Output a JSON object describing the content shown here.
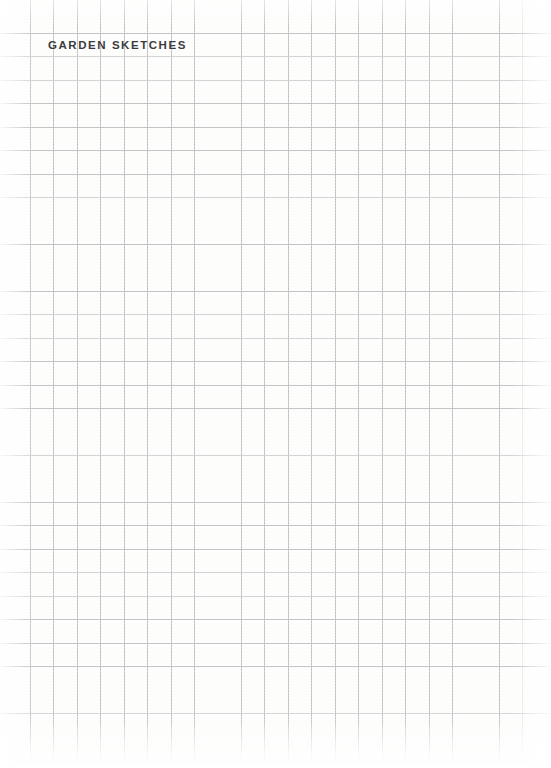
{
  "page": {
    "kind": "grid-paper-sheet",
    "width": 551,
    "height": 768,
    "paper_color": "#fdfdfc",
    "grid_line_color": "#c3c3c8",
    "grid_cell_size": 23.45,
    "grid_origin_x": 30,
    "grid_origin_y": 33
  },
  "header": {
    "title": "GARDEN SKETCHES",
    "title_color": "#3c3c3e"
  },
  "content": {
    "notes": []
  }
}
